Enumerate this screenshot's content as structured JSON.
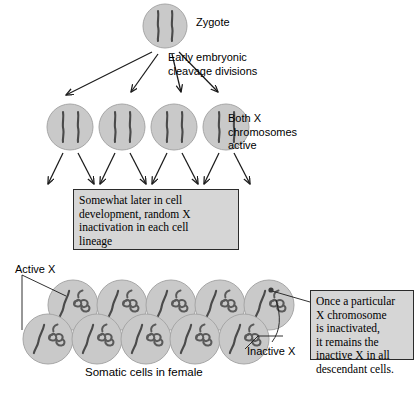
{
  "diagram": {
    "labels": {
      "zygote": "Zygote",
      "cleavage": "Early embryonic\ncleavage divisions",
      "both_x_active": "Both X\nchromosomes\nactive",
      "active_x": "Active X",
      "inactive_x": "Inactive X",
      "somatic": "Somatic cells in female"
    },
    "callouts": {
      "inactivation": "Somewhat later in cell\ndevelopment, random X\ninactivation in each cell\nlineage",
      "descendant": "Once a particular\nX chromosome\nis inactivated,\nit remains the\ninactive X in all\ndescendant cells."
    },
    "colors": {
      "cell_fill": "#c9c9c9",
      "cell_stroke": "#9a9a9a",
      "chromosome": "#4a4a4a",
      "box_fill": "#d6d6d6",
      "box_stroke": "#2b2b2b",
      "arrow": "#1a1a1a",
      "text": "#000000",
      "background": "#ffffff"
    },
    "rows": {
      "zygote_row": {
        "count": 1,
        "cell_radius": 22,
        "chromosome_style": "two-straight-vertical",
        "chromosomes_per_cell": 2
      },
      "blastomere_row": {
        "count": 4,
        "cell_radius": 23,
        "chromosome_style": "two-straight-vertical",
        "chromosomes_per_cell": 2,
        "note": "Both X chromosomes active"
      },
      "somatic_row_top": {
        "count": 5,
        "cell_radius": 25,
        "chromosome_style": "one-straight-diagonal-one-condensed-coil",
        "chromosomes_per_cell": 2
      },
      "somatic_row_bottom": {
        "count": 5,
        "cell_radius": 25,
        "chromosome_style": "one-straight-diagonal-one-condensed-coil",
        "chromosomes_per_cell": 2
      }
    },
    "arrow_groups": {
      "zygote_to_blastomeres": 4,
      "blastomeres_to_inactivation": 8
    }
  }
}
